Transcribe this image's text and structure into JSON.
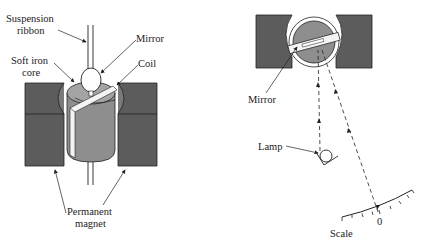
{
  "left_figure": {
    "labels": {
      "suspension_ribbon_line1": "Suspension",
      "suspension_ribbon_line2": "ribbon",
      "mirror": "Mirror",
      "soft_iron_core_line1": "Soft iron",
      "soft_iron_core_line2": "core",
      "coil": "Coil",
      "permanent_magnet_line1": "Permanent",
      "permanent_magnet_line2": "magnet"
    }
  },
  "right_figure": {
    "labels": {
      "mirror": "Mirror",
      "lamp": "Lamp",
      "scale": "Scale",
      "scale_zero": "0"
    }
  },
  "colors": {
    "magnet": "#5a5a5a",
    "core": "#8e8e8e",
    "coil_light": "#c8c8c8",
    "line": "#222222",
    "background": "#ffffff"
  }
}
